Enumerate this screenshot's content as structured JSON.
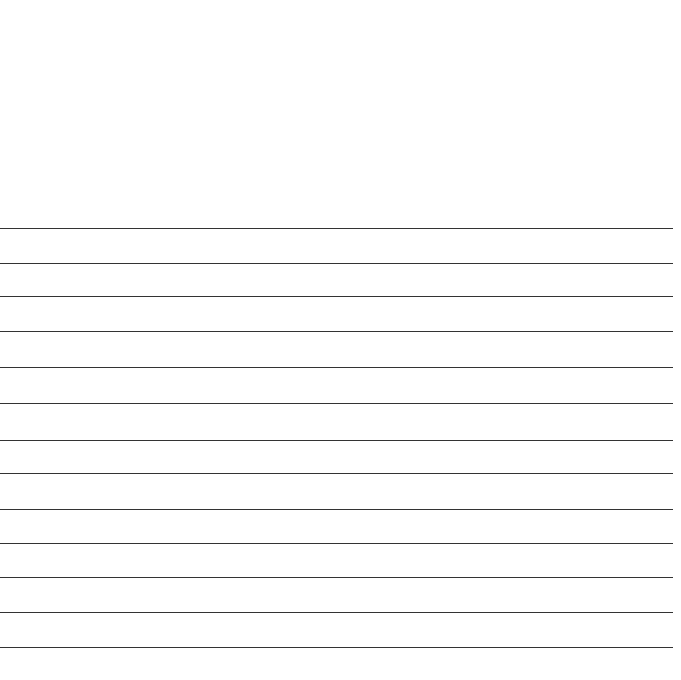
{
  "page": {
    "type": "ruled-paper",
    "width": 681,
    "height": 680,
    "background_color": "#ffffff",
    "text_content": ""
  },
  "rules": {
    "count": 13,
    "color": "#333333",
    "thickness_px": 1.5,
    "line_start_x": 0,
    "line_end_x": 673,
    "line_length_px": 673,
    "first_line_y": 228,
    "last_line_y": 647,
    "spacing_px": 34.9,
    "y_positions": [
      228,
      263,
      296,
      331,
      367,
      403,
      440,
      473,
      509,
      543,
      577,
      612,
      647
    ]
  },
  "header_area": {
    "label": "",
    "top": 0,
    "height": 228,
    "background_color": "#ffffff"
  },
  "footer_area": {
    "label": "",
    "top": 650,
    "height": 30,
    "background_color": "#ffffff"
  }
}
